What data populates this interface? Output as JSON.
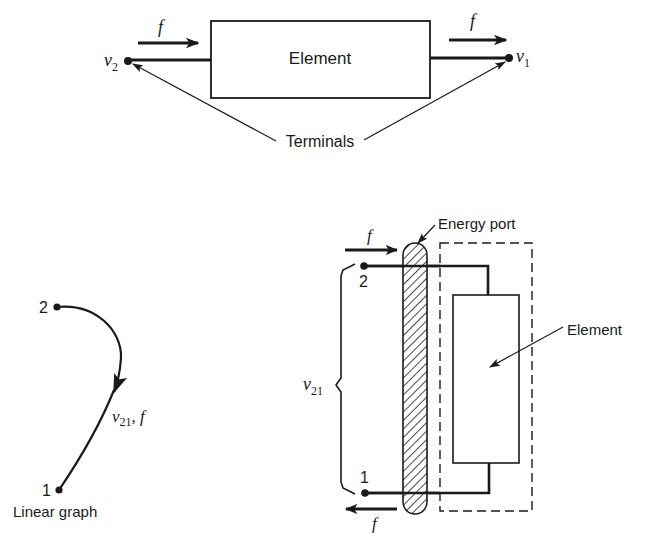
{
  "diagram": {
    "type": "two-terminal element, energy port and linear graph",
    "colors": {
      "ink": "#1a1a1a",
      "background": "#ffffff"
    }
  },
  "top": {
    "element_label": "Element",
    "flow_symbol": "f",
    "left_terminal": {
      "symbol": "v",
      "subscript": "2"
    },
    "right_terminal": {
      "symbol": "v",
      "subscript": "1"
    },
    "callout_label": "Terminals"
  },
  "linear_graph": {
    "node_top": "2",
    "node_bottom": "1",
    "edge_label": {
      "symbol": "v",
      "subscript": "21",
      "suffix": ", f"
    },
    "caption": "Linear graph"
  },
  "port": {
    "callout_label": "Energy port",
    "element_label": "Element",
    "node_top": "2",
    "node_bottom": "1",
    "flow_symbol_top": "f",
    "flow_symbol_bottom": "f",
    "brace_label": {
      "symbol": "v",
      "subscript": "21"
    }
  }
}
